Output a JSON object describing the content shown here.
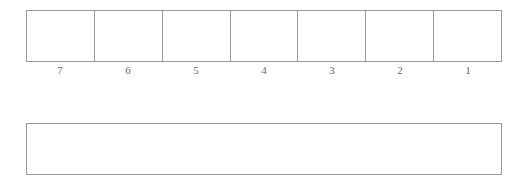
{
  "page": {
    "background_color": "#ffffff",
    "line_color": "#9a9a9a",
    "label_color": "#6d6d6d"
  },
  "cell_strip": {
    "name": "place-value-cell-strip",
    "cell_count": 7,
    "cells": [
      {
        "label": "7",
        "value": ""
      },
      {
        "label": "6",
        "value": ""
      },
      {
        "label": "5",
        "value": ""
      },
      {
        "label": "4",
        "value": ""
      },
      {
        "label": "3",
        "value": ""
      },
      {
        "label": "2",
        "value": ""
      },
      {
        "label": "1",
        "value": ""
      }
    ]
  },
  "answer_box": {
    "name": "answer-box",
    "value": "",
    "placeholder": ""
  }
}
